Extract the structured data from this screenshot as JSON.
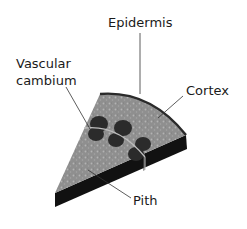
{
  "diagram": {
    "labels": {
      "epidermis": "Epidermis",
      "vascular_cambium_line1": "Vascular",
      "vascular_cambium_line2": "cambium",
      "cortex": "Cortex",
      "pith": "Pith"
    },
    "colors": {
      "top_face": "#8f8f8f",
      "side_face": "#111111",
      "epidermis": "#2a2a2a",
      "vascular_bundle": "#2b2b2b",
      "cambium_ring": "#bdbdbd",
      "leader_line": "#333333",
      "text": "#1a1a1a"
    }
  }
}
